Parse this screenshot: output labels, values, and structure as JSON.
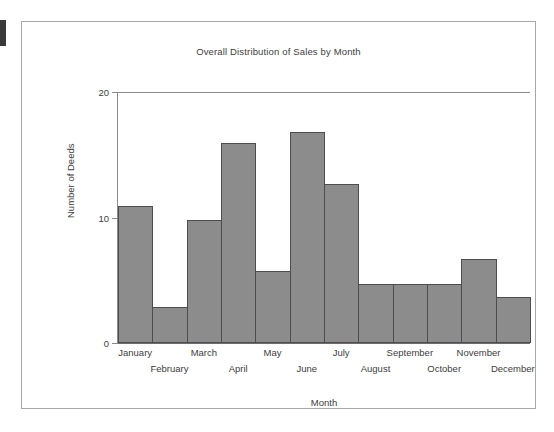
{
  "figure": {
    "title": "Overall Distribution of Sales by Month",
    "y_axis_title": "Number of Deeds",
    "x_axis_title": "Month"
  },
  "chart_data": {
    "type": "bar",
    "title": "Overall Distribution of Sales by Month",
    "xlabel": "Month",
    "ylabel": "Number of Deeds",
    "categories": [
      "January",
      "February",
      "March",
      "April",
      "May",
      "June",
      "July",
      "August",
      "September",
      "October",
      "November",
      "December"
    ],
    "values": [
      10.9,
      2.9,
      9.8,
      15.9,
      5.7,
      16.8,
      12.7,
      4.7,
      4.7,
      4.7,
      6.7,
      3.7
    ],
    "ylim": [
      0,
      20
    ],
    "yticks": [
      0,
      10,
      20
    ],
    "ytick_labels": [
      "0",
      "10",
      "20"
    ],
    "grid": false,
    "legend": false,
    "bar_style": {
      "fill": "#8c8c8c",
      "edge": "#4d4d4d",
      "gap": 0
    }
  },
  "colors": {
    "bar_fill": "#8c8c8c",
    "bar_edge": "#4d4d4d",
    "axis": "#8a8a8a",
    "frame": "#a8a8a8",
    "text": "#3d3d3d",
    "background": "#ffffff"
  }
}
